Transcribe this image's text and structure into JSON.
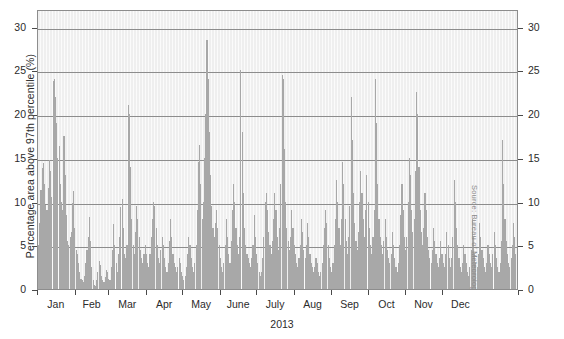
{
  "chart_data": {
    "type": "bar",
    "title": "",
    "subtitle": "",
    "xlabel": "2013",
    "ylabel": "Percentage area above 97th percentile (%)",
    "ylim": [
      0,
      32
    ],
    "yticks": [
      0,
      5,
      10,
      15,
      20,
      25,
      30
    ],
    "ytick_labels": [
      "0",
      "5",
      "10",
      "15",
      "20",
      "25",
      "30"
    ],
    "grid": "horizontal",
    "legend": "none",
    "mirrored_y_axis": true,
    "source": "Source: Bureau of Meteorolog",
    "x_axis_type": "daily",
    "x_tick_labels": [
      "Jan",
      "Feb",
      "Mar",
      "Apr",
      "May",
      "June",
      "July",
      "Aug",
      "Sep",
      "Oct",
      "Nov",
      "Dec"
    ],
    "month_start_days": [
      0,
      31,
      59,
      90,
      120,
      151,
      181,
      212,
      243,
      273,
      304,
      334
    ],
    "month_lengths": [
      31,
      28,
      31,
      30,
      31,
      30,
      31,
      31,
      30,
      31,
      30,
      31
    ],
    "colors": {
      "bar": "#a8a8a8",
      "plot_background": "#efefef",
      "gridline": "#8d8d8d",
      "axis": "#4a4a4a",
      "text": "#2b2b2b",
      "source_text": "#8a8a8a"
    },
    "series_name": "Percentage area above 97th percentile",
    "n_points": 365,
    "max_value": 28.5,
    "min_value": 0.0,
    "values": [
      5.0,
      7.6,
      11.3,
      13.8,
      14.4,
      12.0,
      9.6,
      9.0,
      11.5,
      14.8,
      13.5,
      10.5,
      23.8,
      24.0,
      22.0,
      19.0,
      15.0,
      16.3,
      12.0,
      10.0,
      9.0,
      17.5,
      13.0,
      8.5,
      5.5,
      5.0,
      6.0,
      6.5,
      9.8,
      11.2,
      7.0,
      4.5,
      4.0,
      3.0,
      2.0,
      1.2,
      1.0,
      0.8,
      1.5,
      3.0,
      4.5,
      6.0,
      8.2,
      5.5,
      2.5,
      1.0,
      0.5,
      0.4,
      1.0,
      2.0,
      3.2,
      2.8,
      1.5,
      1.0,
      0.8,
      1.4,
      2.2,
      2.0,
      1.2,
      1.0,
      2.5,
      4.5,
      7.4,
      5.0,
      3.0,
      2.0,
      4.0,
      6.0,
      9.4,
      10.3,
      7.0,
      4.0,
      3.5,
      5.0,
      21.0,
      20.0,
      14.0,
      8.0,
      5.0,
      4.0,
      6.5,
      9.5,
      8.0,
      6.0,
      4.5,
      3.5,
      3.0,
      4.0,
      5.0,
      4.0,
      3.0,
      2.5,
      4.0,
      6.0,
      8.0,
      10.0,
      9.5,
      7.0,
      5.0,
      3.5,
      3.0,
      4.5,
      6.0,
      5.0,
      3.5,
      2.5,
      2.0,
      3.0,
      5.5,
      8.0,
      6.0,
      4.0,
      3.0,
      2.5,
      2.0,
      2.5,
      3.5,
      3.0,
      2.0,
      1.5,
      1.0,
      1.5,
      2.5,
      4.0,
      6.0,
      5.0,
      3.5,
      2.5,
      2.0,
      3.0,
      5.0,
      9.0,
      14.5,
      16.5,
      12.0,
      8.0,
      10.0,
      15.0,
      20.0,
      28.5,
      24.0,
      18.0,
      13.0,
      9.5,
      7.0,
      6.0,
      7.5,
      9.0,
      7.0,
      5.0,
      3.5,
      2.5,
      2.0,
      3.0,
      5.0,
      8.0,
      6.0,
      4.0,
      3.0,
      5.5,
      9.0,
      12.0,
      10.0,
      7.0,
      5.0,
      4.0,
      6.0,
      25.0,
      18.0,
      11.0,
      7.0,
      5.0,
      4.0,
      3.5,
      3.0,
      2.5,
      3.5,
      5.0,
      8.5,
      6.0,
      4.0,
      3.0,
      2.0,
      1.5,
      2.0,
      3.5,
      6.0,
      10.0,
      11.0,
      9.0,
      6.5,
      5.0,
      4.0,
      5.5,
      8.0,
      11.0,
      9.0,
      6.0,
      4.5,
      7.0,
      12.0,
      24.5,
      24.0,
      16.0,
      10.0,
      7.0,
      5.5,
      4.5,
      6.0,
      9.0,
      7.0,
      5.0,
      4.0,
      3.0,
      2.5,
      3.5,
      5.0,
      8.0,
      6.5,
      4.5,
      3.5,
      5.0,
      7.5,
      6.0,
      4.0,
      3.0,
      2.5,
      2.0,
      2.5,
      3.5,
      3.0,
      2.0,
      1.5,
      2.0,
      3.0,
      5.0,
      7.0,
      9.0,
      7.5,
      5.0,
      3.5,
      2.5,
      2.0,
      3.0,
      5.0,
      8.0,
      12.5,
      10.0,
      7.0,
      5.0,
      8.0,
      14.5,
      12.0,
      8.0,
      5.5,
      4.0,
      6.0,
      9.5,
      22.0,
      17.0,
      11.0,
      7.5,
      5.5,
      4.5,
      6.5,
      10.0,
      13.5,
      11.0,
      8.0,
      6.0,
      9.0,
      13.0,
      10.0,
      7.0,
      5.0,
      4.0,
      6.0,
      9.0,
      24.0,
      19.0,
      12.0,
      8.0,
      6.0,
      5.0,
      4.0,
      5.5,
      8.0,
      6.0,
      4.5,
      3.5,
      3.0,
      4.0,
      6.5,
      5.0,
      3.5,
      2.5,
      2.0,
      3.0,
      5.0,
      8.5,
      12.0,
      9.0,
      6.0,
      4.5,
      6.0,
      10.0,
      15.0,
      13.0,
      9.0,
      6.5,
      8.0,
      13.5,
      22.5,
      20.0,
      14.0,
      9.0,
      6.5,
      5.0,
      7.0,
      11.0,
      9.0,
      6.0,
      4.5,
      3.5,
      3.0,
      4.5,
      7.0,
      5.5,
      4.0,
      3.0,
      2.5,
      3.5,
      5.5,
      4.0,
      3.0,
      2.5,
      4.0,
      6.5,
      5.0,
      3.5,
      2.5,
      3.5,
      6.0,
      12.5,
      10.0,
      7.0,
      5.0,
      3.5,
      2.5,
      2.0,
      3.0,
      5.0,
      4.0,
      3.0,
      2.0,
      1.5,
      2.5,
      4.5,
      8.0,
      6.0,
      4.0,
      3.0,
      2.5,
      4.0,
      7.5,
      6.0,
      4.5,
      3.5,
      2.5,
      2.0,
      3.0,
      5.0,
      4.0,
      3.0,
      2.5,
      4.0,
      6.5,
      5.0,
      3.5,
      2.5,
      2.0,
      3.0,
      5.5,
      17.0,
      12.0,
      8.0,
      5.5,
      4.0,
      3.0,
      2.5,
      3.5,
      5.0,
      7.5,
      6.0,
      4.0,
      3.0,
      2.0
    ]
  }
}
